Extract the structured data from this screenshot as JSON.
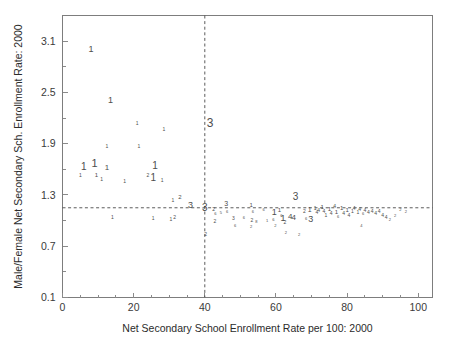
{
  "figure": {
    "background_color": "#ffffff",
    "frame_color": "#7d7d7d",
    "marker_color": "#4d4d4d",
    "refline_color": "#4a4a4a"
  },
  "chart_data": {
    "type": "scatter",
    "title": "",
    "xlabel": "Net Secondary School Enrollment Rate per 100: 2000",
    "ylabel": "Male/Female Net Secondary Sch. Enrollment Rate: 2000",
    "xlim": [
      0,
      104
    ],
    "ylim": [
      0.1,
      3.4
    ],
    "xticks": [
      0,
      20,
      40,
      60,
      80,
      100
    ],
    "xtick_labels": [
      "0",
      "20",
      "40",
      "60",
      "80",
      "100"
    ],
    "yticks": [
      0.1,
      0.7,
      1.3,
      1.9,
      2.5,
      3.1
    ],
    "ytick_labels": [
      "0.1",
      "0.7",
      "1.3",
      "1.9",
      "2.5",
      "3.1"
    ],
    "x_minor_ticks": [
      5,
      10,
      15,
      25,
      30,
      35,
      45,
      50,
      55,
      65,
      70,
      75,
      85,
      90,
      95
    ],
    "y_minor_ticks": [
      0.4,
      1.0,
      1.6,
      2.2,
      2.8
    ],
    "grid": false,
    "legend": null,
    "annotations": [
      {
        "name": "vertical-reference-line",
        "type": "vline",
        "x": 40
      },
      {
        "name": "horizontal-reference-line",
        "type": "hline",
        "y": 1.15
      }
    ],
    "marker_encoding": "Each point is drawn as the digit character of its group code (1, 2 or 3); glyph size is proportional to a weight.",
    "groups": [
      "1",
      "2",
      "3"
    ],
    "points": [
      {
        "x": 8.0,
        "y": 3.0,
        "label": "1",
        "size": 9
      },
      {
        "x": 13.5,
        "y": 2.4,
        "label": "1",
        "size": 9
      },
      {
        "x": 21.0,
        "y": 2.13,
        "label": "1",
        "size": 5
      },
      {
        "x": 28.5,
        "y": 2.06,
        "label": "1",
        "size": 5
      },
      {
        "x": 41.5,
        "y": 2.13,
        "label": "3",
        "size": 12
      },
      {
        "x": 12.5,
        "y": 1.87,
        "label": "1",
        "size": 5
      },
      {
        "x": 21.5,
        "y": 1.86,
        "label": "1",
        "size": 5
      },
      {
        "x": 6.0,
        "y": 1.62,
        "label": "1",
        "size": 10
      },
      {
        "x": 9.0,
        "y": 1.66,
        "label": "1",
        "size": 11
      },
      {
        "x": 12.5,
        "y": 1.62,
        "label": "1",
        "size": 8
      },
      {
        "x": 26.0,
        "y": 1.64,
        "label": "1",
        "size": 10
      },
      {
        "x": 5.0,
        "y": 1.52,
        "label": "1",
        "size": 5
      },
      {
        "x": 9.5,
        "y": 1.53,
        "label": "1",
        "size": 6
      },
      {
        "x": 11.0,
        "y": 1.48,
        "label": "1",
        "size": 5
      },
      {
        "x": 24.0,
        "y": 1.52,
        "label": "2",
        "size": 5
      },
      {
        "x": 25.5,
        "y": 1.5,
        "label": "1",
        "size": 10
      },
      {
        "x": 28.0,
        "y": 1.47,
        "label": "1",
        "size": 5
      },
      {
        "x": 17.5,
        "y": 1.46,
        "label": "1",
        "size": 5
      },
      {
        "x": 31.0,
        "y": 1.23,
        "label": "1",
        "size": 5
      },
      {
        "x": 33.0,
        "y": 1.27,
        "label": "2",
        "size": 6
      },
      {
        "x": 36.0,
        "y": 1.17,
        "label": "3",
        "size": 9
      },
      {
        "x": 40.0,
        "y": 1.14,
        "label": "3",
        "size": 10
      },
      {
        "x": 14.0,
        "y": 1.03,
        "label": "1",
        "size": 5
      },
      {
        "x": 25.5,
        "y": 1.02,
        "label": "1",
        "size": 5
      },
      {
        "x": 30.5,
        "y": 1.01,
        "label": "1",
        "size": 5
      },
      {
        "x": 31.5,
        "y": 1.04,
        "label": "2",
        "size": 5
      },
      {
        "x": 40.2,
        "y": 0.84,
        "label": "2",
        "size": 5
      },
      {
        "x": 42.5,
        "y": 1.13,
        "label": "2",
        "size": 5
      },
      {
        "x": 43.0,
        "y": 1.08,
        "label": "6",
        "size": 4
      },
      {
        "x": 44.5,
        "y": 1.09,
        "label": "5",
        "size": 4
      },
      {
        "x": 42.8,
        "y": 0.99,
        "label": "2",
        "size": 5
      },
      {
        "x": 46.0,
        "y": 1.19,
        "label": "3",
        "size": 7
      },
      {
        "x": 46.3,
        "y": 1.1,
        "label": "6",
        "size": 4
      },
      {
        "x": 48.0,
        "y": 1.02,
        "label": "3",
        "size": 5
      },
      {
        "x": 48.5,
        "y": 0.94,
        "label": "6",
        "size": 4
      },
      {
        "x": 51.0,
        "y": 1.03,
        "label": "6",
        "size": 4
      },
      {
        "x": 53.0,
        "y": 1.18,
        "label": "1",
        "size": 6
      },
      {
        "x": 53.5,
        "y": 1.1,
        "label": "6",
        "size": 4
      },
      {
        "x": 53.2,
        "y": 1.0,
        "label": "2",
        "size": 5
      },
      {
        "x": 54.5,
        "y": 0.99,
        "label": "8",
        "size": 4
      },
      {
        "x": 53.0,
        "y": 0.92,
        "label": "2",
        "size": 4
      },
      {
        "x": 56.5,
        "y": 1.12,
        "label": "6",
        "size": 4
      },
      {
        "x": 57.5,
        "y": 1.0,
        "label": "1",
        "size": 4
      },
      {
        "x": 59.5,
        "y": 1.09,
        "label": "1",
        "size": 9
      },
      {
        "x": 59.3,
        "y": 1.01,
        "label": "6",
        "size": 4
      },
      {
        "x": 59.8,
        "y": 0.94,
        "label": "2",
        "size": 4
      },
      {
        "x": 61.0,
        "y": 1.12,
        "label": "1",
        "size": 6
      },
      {
        "x": 61.5,
        "y": 1.06,
        "label": "6",
        "size": 4
      },
      {
        "x": 62.0,
        "y": 1.02,
        "label": "1",
        "size": 9
      },
      {
        "x": 62.5,
        "y": 0.98,
        "label": "2",
        "size": 5
      },
      {
        "x": 62.8,
        "y": 0.86,
        "label": "2",
        "size": 4
      },
      {
        "x": 64.0,
        "y": 1.04,
        "label": "4",
        "size": 8
      },
      {
        "x": 65.0,
        "y": 1.03,
        "label": "4",
        "size": 8
      },
      {
        "x": 65.5,
        "y": 1.27,
        "label": "3",
        "size": 10
      },
      {
        "x": 68.0,
        "y": 1.1,
        "label": "2",
        "size": 5
      },
      {
        "x": 68.5,
        "y": 1.02,
        "label": "6",
        "size": 4
      },
      {
        "x": 69.5,
        "y": 1.12,
        "label": "1",
        "size": 7
      },
      {
        "x": 69.8,
        "y": 1.01,
        "label": "3",
        "size": 9
      },
      {
        "x": 71.0,
        "y": 1.14,
        "label": "1",
        "size": 5
      },
      {
        "x": 71.5,
        "y": 1.09,
        "label": "4",
        "size": 5
      },
      {
        "x": 72.0,
        "y": 1.12,
        "label": "4",
        "size": 5
      },
      {
        "x": 73.0,
        "y": 1.15,
        "label": "1",
        "size": 6
      },
      {
        "x": 73.5,
        "y": 1.1,
        "label": "4",
        "size": 5
      },
      {
        "x": 74.0,
        "y": 1.06,
        "label": "1",
        "size": 5
      },
      {
        "x": 75.0,
        "y": 1.13,
        "label": "1",
        "size": 6
      },
      {
        "x": 75.5,
        "y": 1.08,
        "label": "4",
        "size": 5
      },
      {
        "x": 76.5,
        "y": 1.16,
        "label": "4",
        "size": 5
      },
      {
        "x": 77.0,
        "y": 1.1,
        "label": "1",
        "size": 6
      },
      {
        "x": 77.5,
        "y": 1.04,
        "label": "6",
        "size": 4
      },
      {
        "x": 78.5,
        "y": 1.14,
        "label": "1",
        "size": 6
      },
      {
        "x": 79.0,
        "y": 1.08,
        "label": "4",
        "size": 5
      },
      {
        "x": 80.0,
        "y": 1.12,
        "label": "1",
        "size": 6
      },
      {
        "x": 80.5,
        "y": 1.06,
        "label": "4",
        "size": 5
      },
      {
        "x": 81.5,
        "y": 1.11,
        "label": "1",
        "size": 5
      },
      {
        "x": 82.0,
        "y": 1.14,
        "label": "4",
        "size": 5
      },
      {
        "x": 83.0,
        "y": 1.09,
        "label": "1",
        "size": 5
      },
      {
        "x": 83.5,
        "y": 1.13,
        "label": "4",
        "size": 5
      },
      {
        "x": 84.5,
        "y": 1.08,
        "label": "6",
        "size": 4
      },
      {
        "x": 85.0,
        "y": 1.12,
        "label": "4",
        "size": 5
      },
      {
        "x": 86.0,
        "y": 1.09,
        "label": "4",
        "size": 5
      },
      {
        "x": 87.0,
        "y": 1.11,
        "label": "4",
        "size": 5
      },
      {
        "x": 88.0,
        "y": 1.08,
        "label": "4",
        "size": 5
      },
      {
        "x": 89.0,
        "y": 1.1,
        "label": "4",
        "size": 5
      },
      {
        "x": 90.0,
        "y": 1.06,
        "label": "4",
        "size": 5
      },
      {
        "x": 91.0,
        "y": 1.04,
        "label": "4",
        "size": 5
      },
      {
        "x": 92.0,
        "y": 1.01,
        "label": "2",
        "size": 4
      },
      {
        "x": 93.5,
        "y": 1.05,
        "label": "2",
        "size": 4
      },
      {
        "x": 95.0,
        "y": 1.12,
        "label": "2",
        "size": 4
      },
      {
        "x": 96.5,
        "y": 1.1,
        "label": "2",
        "size": 4
      },
      {
        "x": 66.5,
        "y": 0.83,
        "label": "2",
        "size": 4
      },
      {
        "x": 84.0,
        "y": 0.94,
        "label": "4",
        "size": 4
      }
    ]
  }
}
